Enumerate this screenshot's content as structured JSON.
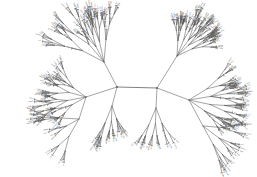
{
  "figure": {
    "type": "unrooted-radial-phylogenetic-tree",
    "title": "",
    "background_color": "#ffffff",
    "edge_color": "#5a5a5a",
    "label_color": "#4e4e4e",
    "width": 257,
    "height": 177
  },
  "chart_data": {
    "type": "tree",
    "layout": "unrooted-radial",
    "title": "",
    "xlabel": "",
    "ylabel": "",
    "grid": false,
    "legend": "none",
    "xlim": [
      0,
      257
    ],
    "ylim": [
      0,
      177
    ],
    "hubs": [
      {
        "id": "hubL",
        "x": 117,
        "y": 87
      },
      {
        "id": "hubR",
        "x": 157,
        "y": 88
      }
    ],
    "backbone_edges": [
      {
        "from": "hubL",
        "to": "hubR"
      }
    ],
    "clades": [
      {
        "name": "upper-left-clade",
        "root": [
          117,
          87
        ],
        "stem_to": [
          104,
          62
        ],
        "spread_deg": 62,
        "center_deg": -118,
        "depth": 4,
        "leaf_count": 34
      },
      {
        "name": "left-clade",
        "root": [
          117,
          87
        ],
        "stem_to": [
          86,
          97
        ],
        "spread_deg": 70,
        "center_deg": 185,
        "depth": 4,
        "leaf_count": 30
      },
      {
        "name": "lower-left-clade",
        "root": [
          86,
          97
        ],
        "stem_to": [
          79,
          119
        ],
        "spread_deg": 62,
        "center_deg": 150,
        "depth": 3,
        "leaf_count": 22
      },
      {
        "name": "lower-center-left-clade",
        "root": [
          117,
          87
        ],
        "stem_to": [
          112,
          106
        ],
        "spread_deg": 44,
        "center_deg": 92,
        "depth": 3,
        "leaf_count": 16
      },
      {
        "name": "upper-right-clade",
        "root": [
          157,
          88
        ],
        "stem_to": [
          177,
          56
        ],
        "spread_deg": 58,
        "center_deg": -56,
        "depth": 4,
        "leaf_count": 32
      },
      {
        "name": "right-clade",
        "root": [
          157,
          88
        ],
        "stem_to": [
          189,
          100
        ],
        "spread_deg": 66,
        "center_deg": 2,
        "depth": 4,
        "leaf_count": 28
      },
      {
        "name": "lower-right-clade",
        "root": [
          189,
          100
        ],
        "stem_to": [
          203,
          126
        ],
        "spread_deg": 58,
        "center_deg": 34,
        "depth": 3,
        "leaf_count": 24
      },
      {
        "name": "lower-center-right-clade",
        "root": [
          157,
          88
        ],
        "stem_to": [
          156,
          108
        ],
        "spread_deg": 46,
        "center_deg": 90,
        "depth": 3,
        "leaf_count": 18
      }
    ],
    "total_leaves": 204,
    "annotations": []
  }
}
